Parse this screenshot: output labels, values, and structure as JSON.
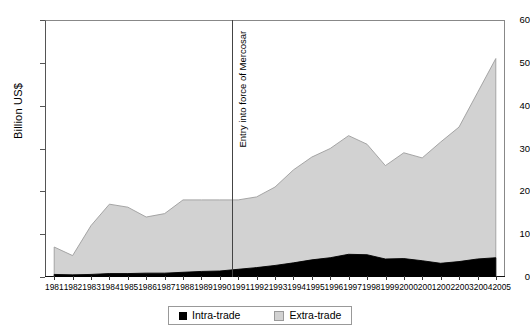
{
  "chart_data": {
    "type": "area",
    "stacked": true,
    "title": "",
    "xlabel": "",
    "ylabel": "Billion US$",
    "ylim": [
      0,
      60
    ],
    "yticks": [
      0,
      10,
      20,
      30,
      40,
      50,
      60
    ],
    "grid": false,
    "legend_position": "bottom",
    "categories": [
      "1981",
      "1982",
      "1983",
      "1984",
      "1985",
      "1986",
      "1987",
      "1988",
      "1989",
      "1990",
      "1991",
      "1992",
      "1993",
      "1994",
      "1995",
      "1996",
      "1997",
      "1998",
      "1999",
      "2000",
      "2001",
      "2002",
      "2003",
      "2004",
      "2005"
    ],
    "series": [
      {
        "name": "Intra-trade",
        "color": "#000000",
        "values": [
          0.6,
          0.5,
          0.6,
          0.8,
          0.8,
          0.9,
          0.9,
          1.1,
          1.3,
          1.4,
          1.8,
          2.2,
          2.7,
          3.3,
          4.0,
          4.5,
          5.3,
          5.2,
          4.2,
          4.3,
          3.8,
          3.2,
          3.6,
          4.2,
          4.5
        ]
      },
      {
        "name": "Extra-trade",
        "color": "#d2d2d2",
        "values": [
          6.4,
          4.5,
          11.4,
          16.2,
          15.5,
          13.1,
          13.9,
          16.9,
          16.7,
          16.6,
          16.2,
          16.5,
          18.3,
          21.7,
          24.0,
          25.5,
          27.7,
          25.8,
          21.8,
          24.7,
          24.0,
          28.3,
          31.4,
          38.8,
          46.5
        ]
      }
    ],
    "totals": [
      7.0,
      5.0,
      12.0,
      17.0,
      16.3,
      14.0,
      14.8,
      18.0,
      18.0,
      18.0,
      18.0,
      18.7,
      21.0,
      25.0,
      28.0,
      30.0,
      33.0,
      31.0,
      26.0,
      29.0,
      27.8,
      31.5,
      35.0,
      43.0,
      51.0
    ],
    "annotations": [
      {
        "name": "mercosur-entry",
        "label": "Entry into force of Mercosar",
        "x": "1991",
        "type": "vertical-line"
      }
    ]
  },
  "legend": {
    "items": [
      {
        "label": "Intra-trade",
        "swatch": "black-square-icon"
      },
      {
        "label": "Extra-trade",
        "swatch": "gray-square-icon"
      }
    ]
  }
}
